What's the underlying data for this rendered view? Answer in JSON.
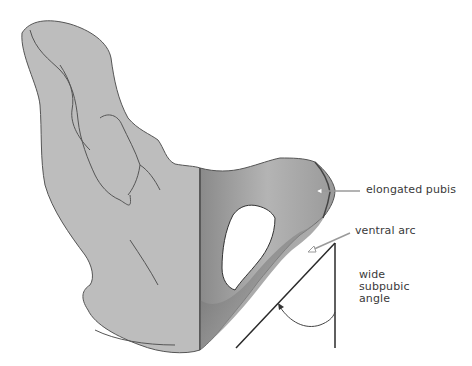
{
  "figure": {
    "colors": {
      "bone_fill": "#bdbdbd",
      "bone_outline": "#555555",
      "pubis_dark": "#6e6e6e",
      "pointer_line": "#9a9a9a",
      "angle_line": "#2a2a2a",
      "label_text": "#3a3a3a"
    }
  },
  "labels": {
    "elongated_pubis": "elongated pubis",
    "ventral_arc": "ventral arc",
    "subpubic_angle": [
      "wide",
      "subpubic",
      "angle"
    ]
  }
}
